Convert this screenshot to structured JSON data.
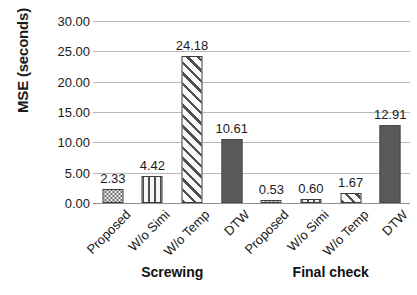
{
  "chart_data": {
    "type": "bar",
    "title": "",
    "subtitle": "",
    "xlabel": "",
    "ylabel": "MSE (seconds)",
    "ylim": [
      0,
      30
    ],
    "ytick_step": 5,
    "ytick_labels": [
      "0.00",
      "5.00",
      "10.00",
      "15.00",
      "20.00",
      "25.00",
      "30.00"
    ],
    "ytick_values": [
      0,
      5,
      10,
      15,
      20,
      25,
      30
    ],
    "grid": "horizontal",
    "legend": "none",
    "group_labels": [
      "Screwing",
      "Final check"
    ],
    "categories": [
      "Proposed",
      "W/o Simi",
      "W/o Temp",
      "DTW",
      "Proposed",
      "W/o Simi",
      "W/o Temp",
      "DTW"
    ],
    "values": [
      2.33,
      4.42,
      24.18,
      10.61,
      0.53,
      0.6,
      1.67,
      12.91
    ],
    "value_labels": [
      "2.33",
      "4.42",
      "24.18",
      "10.61",
      "0.53",
      "0.60",
      "1.67",
      "12.91"
    ],
    "bar_fills": [
      "dots",
      "vstripe",
      "diag",
      "solid",
      "dots",
      "vstripe",
      "diag",
      "solid"
    ],
    "groups": [
      {
        "name": "Screwing",
        "categories": [
          "Proposed",
          "W/o Simi",
          "W/o Temp",
          "DTW"
        ],
        "values": [
          2.33,
          4.42,
          24.18,
          10.61
        ]
      },
      {
        "name": "Final check",
        "categories": [
          "Proposed",
          "W/o Simi",
          "W/o Temp",
          "DTW"
        ],
        "values": [
          0.53,
          0.6,
          1.67,
          12.91
        ]
      }
    ],
    "colors": {
      "solid_bar": "#595959",
      "pattern_line": "#4f4f4f",
      "bar_outline": "#3d3d3d",
      "gridline": "#b8b8b8",
      "text": "#1a1a1a",
      "background": "#ffffff"
    }
  }
}
